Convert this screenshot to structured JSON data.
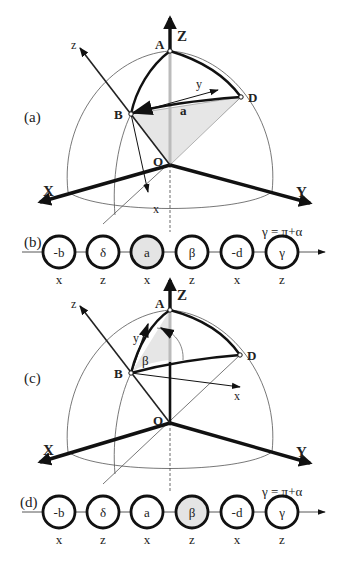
{
  "panels": {
    "a": {
      "label": "(a)",
      "points": {
        "A": "A",
        "B": "B",
        "D": "D",
        "O": "O"
      },
      "global_axes": {
        "X": "X",
        "Y": "Y",
        "Z": "Z"
      },
      "local_axes": {
        "x": "x",
        "y": "y",
        "z": "z"
      },
      "angle_label": "a"
    },
    "b": {
      "label": "(b)",
      "annotation": "γ = π+α",
      "nodes": [
        {
          "value": "-b",
          "axis": "x",
          "highlighted": false
        },
        {
          "value": "δ",
          "axis": "z",
          "highlighted": false
        },
        {
          "value": "a",
          "axis": "x",
          "highlighted": true
        },
        {
          "value": "β",
          "axis": "z",
          "highlighted": false
        },
        {
          "value": "-d",
          "axis": "x",
          "highlighted": false
        },
        {
          "value": "γ",
          "axis": "z",
          "highlighted": false
        }
      ]
    },
    "c": {
      "label": "(c)",
      "points": {
        "A": "A",
        "B": "B",
        "D": "D",
        "O": "O"
      },
      "global_axes": {
        "X": "X",
        "Y": "Y",
        "Z": "Z"
      },
      "local_axes": {
        "x": "x",
        "y": "y",
        "z": "z"
      },
      "angle_label": "β"
    },
    "d": {
      "label": "(d)",
      "annotation": "γ = π+α",
      "nodes": [
        {
          "value": "-b",
          "axis": "x",
          "highlighted": false
        },
        {
          "value": "δ",
          "axis": "z",
          "highlighted": false
        },
        {
          "value": "a",
          "axis": "x",
          "highlighted": false
        },
        {
          "value": "β",
          "axis": "z",
          "highlighted": true
        },
        {
          "value": "-d",
          "axis": "x",
          "highlighted": false
        },
        {
          "value": "γ",
          "axis": "z",
          "highlighted": false
        }
      ]
    }
  },
  "colors": {
    "highlight": "#e4e4e4",
    "stroke": "#111111",
    "shade": "#e6e6e6"
  }
}
